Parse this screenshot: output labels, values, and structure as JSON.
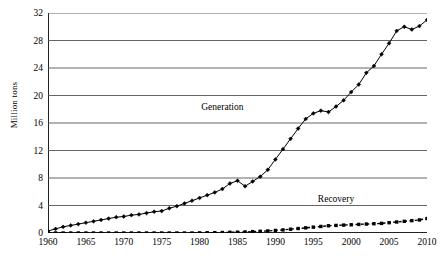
{
  "chart_data": {
    "type": "line",
    "title": "",
    "xlabel": "",
    "ylabel": "Million tons",
    "xlim": [
      1960,
      2010
    ],
    "ylim": [
      0,
      32
    ],
    "ytick_step": 4,
    "xtick_step": 5,
    "minor_xtick_step": 1,
    "grid": "horizontal",
    "legend_position": "inline-annotations",
    "ytick_labels": [
      "0",
      "4",
      "8",
      "12",
      "16",
      "20",
      "24",
      "28",
      "32"
    ],
    "ytick_values": [
      0,
      4,
      8,
      12,
      16,
      20,
      24,
      28,
      32
    ],
    "xtick_labels": [
      "1960",
      "1965",
      "1970",
      "1975",
      "1980",
      "1985",
      "1990",
      "1995",
      "2000",
      "2005",
      "2010"
    ],
    "xtick_values": [
      1960,
      1965,
      1970,
      1975,
      1980,
      1985,
      1990,
      1995,
      2000,
      2005,
      2010
    ],
    "x": [
      1960,
      1961,
      1962,
      1963,
      1964,
      1965,
      1966,
      1967,
      1968,
      1969,
      1970,
      1971,
      1972,
      1973,
      1974,
      1975,
      1976,
      1977,
      1978,
      1979,
      1980,
      1981,
      1982,
      1983,
      1984,
      1985,
      1986,
      1987,
      1988,
      1989,
      1990,
      1991,
      1992,
      1993,
      1994,
      1995,
      1996,
      1997,
      1998,
      1999,
      2000,
      2001,
      2002,
      2003,
      2004,
      2005,
      2006,
      2007,
      2008,
      2009,
      2010
    ],
    "series": [
      {
        "name": "Generation",
        "style": "solid",
        "marker": "diamond",
        "color": "#000000",
        "label_x": 1983,
        "label_y": 18.3,
        "values": [
          0.3,
          0.6,
          0.9,
          1.1,
          1.3,
          1.5,
          1.7,
          1.9,
          2.1,
          2.3,
          2.4,
          2.6,
          2.7,
          2.9,
          3.1,
          3.2,
          3.6,
          3.9,
          4.3,
          4.7,
          5.1,
          5.5,
          5.9,
          6.4,
          7.2,
          7.6,
          6.8,
          7.5,
          8.2,
          9.2,
          10.7,
          12.2,
          13.7,
          15.2,
          16.6,
          17.4,
          17.8,
          17.6,
          18.4,
          19.3,
          20.5,
          21.6,
          23.3,
          24.3,
          26.0,
          27.6,
          29.4,
          30.0,
          29.6,
          30.1,
          31.0
        ]
      },
      {
        "name": "Recovery",
        "style": "dashed",
        "marker": "square",
        "color": "#000000",
        "label_x": 1998,
        "label_y": 5.0,
        "values": [
          0.0,
          0.0,
          0.0,
          0.0,
          0.0,
          0.0,
          0.0,
          0.0,
          0.0,
          0.0,
          0.0,
          0.0,
          0.0,
          0.0,
          0.0,
          0.0,
          0.0,
          0.0,
          0.0,
          0.0,
          0.02,
          0.04,
          0.05,
          0.07,
          0.1,
          0.12,
          0.15,
          0.2,
          0.25,
          0.3,
          0.37,
          0.45,
          0.55,
          0.65,
          0.75,
          0.85,
          0.95,
          1.05,
          1.1,
          1.15,
          1.2,
          1.25,
          1.3,
          1.35,
          1.4,
          1.5,
          1.6,
          1.7,
          1.8,
          1.9,
          2.1
        ]
      }
    ]
  }
}
